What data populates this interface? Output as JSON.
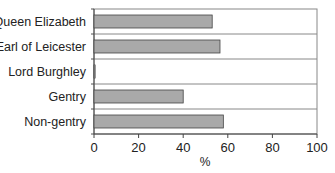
{
  "chart_data": {
    "type": "bar",
    "orientation": "horizontal",
    "title": "",
    "xlabel": "%",
    "ylabel": "",
    "categories": [
      "Queen Elizabeth",
      "Earl of Leicester",
      "Lord Burghley",
      "Gentry",
      "Non-gentry"
    ],
    "values": [
      53,
      56.5,
      0.5,
      40,
      58
    ],
    "xlim": [
      0,
      100
    ],
    "xticks": [
      0,
      20,
      40,
      60,
      80,
      100
    ],
    "grid": "horizontal category separators",
    "legend": null,
    "bar_color": "#a9a9a9",
    "bar_edge_color": "#444444"
  }
}
